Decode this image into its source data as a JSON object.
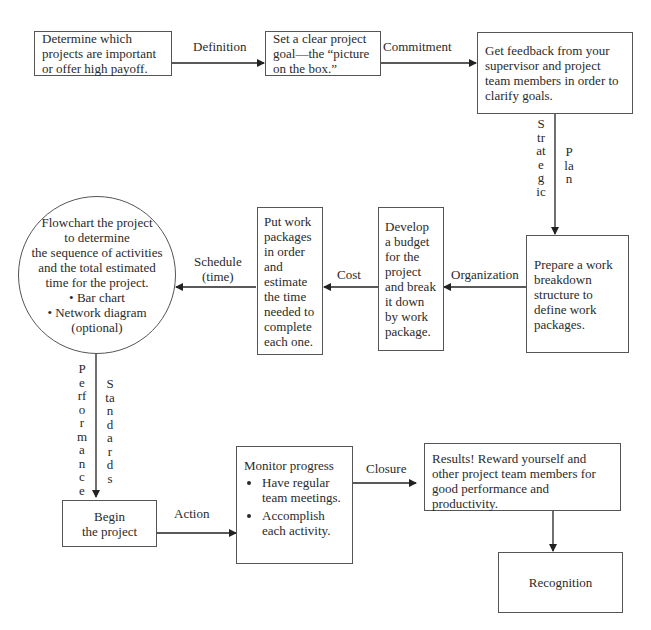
{
  "nodes": {
    "determine": "Determine which projects are important or offer high payoff.",
    "goal": "Set a clear project goal—the “picture on the box.”",
    "feedback": "Get feedback from your supervisor and project team members in order to clarify goals.",
    "wbs": "Prepare a work breakdown structure to define work packages.",
    "budget": "Develop a budget for the project and break it down by work package.",
    "packages": "Put work packages in order and estimate the time needed to complete each one.",
    "flowchart": {
      "lines": [
        "Flowchart the project",
        "to determine",
        "the sequence of activities",
        "and the total estimated",
        "time for the project."
      ],
      "bullets": [
        "• Bar chart",
        "• Network diagram",
        "(optional)"
      ]
    },
    "begin": [
      "Begin",
      "the project"
    ],
    "monitor": {
      "title": "Monitor progress",
      "bullets": [
        "Have regular team meetings.",
        "Accomplish each activity."
      ]
    },
    "results": "Results! Reward yourself and other project team members for good performance and productivity.",
    "recognition": "Recognition"
  },
  "edges": {
    "definition": "Definition",
    "commitment": "Commitment",
    "strategic": "Strategic",
    "plan": "Plan",
    "organization": "Organization",
    "cost": "Cost",
    "schedule": [
      "Schedule",
      "(time)"
    ],
    "performance": "Performance",
    "standards": "Standards",
    "action": "Action",
    "closure": "Closure"
  }
}
